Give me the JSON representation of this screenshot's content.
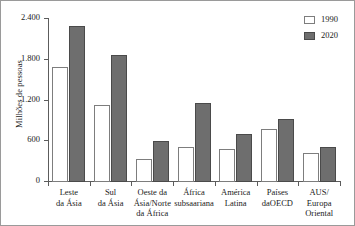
{
  "chart_data": {
    "type": "bar",
    "title": "",
    "subtitle": "",
    "xlabel": "",
    "ylabel": "Milhões de pessoas",
    "ylim": [
      0,
      2400
    ],
    "ytick_labels": [
      "0",
      "600",
      "1.200",
      "1.800",
      "2.400"
    ],
    "ytick_values": [
      0,
      600,
      1200,
      1800,
      2400
    ],
    "grid": false,
    "legend_position": "top-right",
    "categories": [
      "Leste da Ásia",
      "Sul da Ásia",
      "Oeste da Ásia/Norte da África",
      "África subsaariana",
      "América Latina",
      "Países daOECD",
      "AUS/Europa Oriental"
    ],
    "category_lines": [
      [
        "Leste",
        "da Ásia"
      ],
      [
        "Sul",
        "da Ásia"
      ],
      [
        "Oeste da",
        "Ásia/Norte",
        "da África"
      ],
      [
        "África",
        "subsaariana"
      ],
      [
        "América",
        "Latina"
      ],
      [
        "Países",
        "daOECD"
      ],
      [
        "AUS/",
        "Europa",
        "Oriental"
      ]
    ],
    "series": [
      {
        "name": "1990",
        "color": "#ffffff",
        "values": [
          1700,
          1140,
          340,
          515,
          480,
          775,
          430
        ]
      },
      {
        "name": "2020",
        "color": "#6e6e6e",
        "values": [
          2300,
          1870,
          600,
          1170,
          700,
          935,
          515
        ]
      }
    ]
  },
  "legend": {
    "items": [
      {
        "label": "1990",
        "swatch": "legend-swatch-1990"
      },
      {
        "label": "2020",
        "swatch": "legend-swatch-2020"
      }
    ]
  }
}
